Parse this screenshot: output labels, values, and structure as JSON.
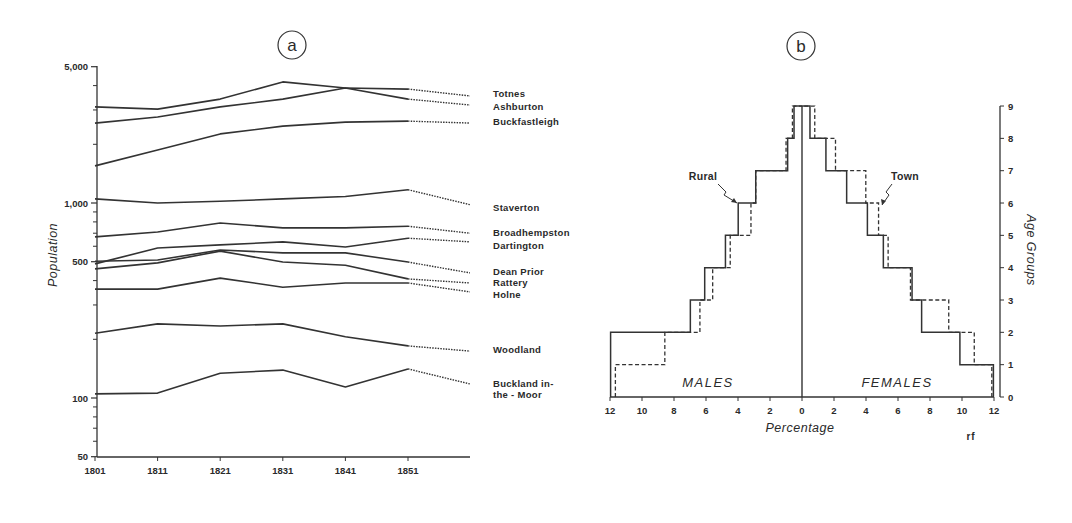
{
  "figure": {
    "panel_a": {
      "letter": "a"
    },
    "panel_b": {
      "letter": "b"
    },
    "credit": "rf"
  },
  "colors": {
    "ink": "#2a2a2a",
    "background": "#ffffff"
  },
  "chart_data": [
    {
      "id": "a",
      "type": "line",
      "title": "a",
      "xlabel": "",
      "ylabel": "Population",
      "yscale": "log",
      "ylim": [
        50,
        5000
      ],
      "y_tick_labels": [
        "5,000",
        "1,000",
        "500",
        "100",
        "50"
      ],
      "y_ticks": [
        5000,
        1000,
        500,
        100,
        50
      ],
      "y_minor_ticks": [
        4000,
        3000,
        2000,
        900,
        800,
        700,
        600,
        400,
        300,
        200,
        90,
        80,
        70,
        60
      ],
      "x": [
        "1801",
        "1811",
        "1821",
        "1831",
        "1841",
        "1851"
      ],
      "grid": false,
      "legend": "direct labels at right end of lines; dotted projection beyond 1851",
      "series": [
        {
          "name": "Totnes",
          "values": [
            2570,
            2760,
            3110,
            3410,
            3890,
            3840
          ],
          "projected_end": 3540
        },
        {
          "name": "Ashburton",
          "values": [
            3110,
            3030,
            3410,
            4180,
            3890,
            3410
          ],
          "projected_end": 3180
        },
        {
          "name": "Buckfastleigh",
          "values": [
            1550,
            1870,
            2260,
            2480,
            2600,
            2630
          ],
          "projected_end": 2570
        },
        {
          "name": "Staverton",
          "values": [
            1050,
            1000,
            1020,
            1050,
            1080,
            1170
          ],
          "projected_end": 980
        },
        {
          "name": "Broadhempston",
          "values": [
            670,
            710,
            790,
            745,
            745,
            760
          ],
          "projected_end": 700
        },
        {
          "name": "Dartington",
          "values": [
            487,
            588,
            610,
            632,
            595,
            660
          ],
          "projected_end": 632
        },
        {
          "name": "Dean Prior",
          "values": [
            503,
            510,
            574,
            555,
            555,
            498
          ],
          "projected_end": 438
        },
        {
          "name": "Rattery",
          "values": [
            459,
            493,
            567,
            498,
            480,
            408
          ],
          "projected_end": 389
        },
        {
          "name": "Holne",
          "values": [
            362,
            362,
            412,
            370,
            389,
            389
          ],
          "projected_end": 350
        },
        {
          "name": "Woodland",
          "values": [
            215,
            240,
            234,
            240,
            206,
            185
          ],
          "projected_end": 174
        },
        {
          "name": "Buckland in-the-Moor",
          "label_lines": [
            "Buckland in-",
            "the - Moor"
          ],
          "values": [
            105,
            106,
            134,
            139,
            114,
            141
          ],
          "projected_end": 118
        }
      ],
      "label_y": {
        "Totnes": 97,
        "Ashburton": 110,
        "Buckfastleigh": 125,
        "Staverton": 211,
        "Broadhempston": 236,
        "Dartington": 249,
        "Dean Prior": 275,
        "Rattery": 286,
        "Holne": 298,
        "Woodland": 353,
        "Buckland in-the-Moor": 387
      }
    },
    {
      "id": "b",
      "type": "bar",
      "subtype": "population-pyramid (step outline)",
      "title": "b",
      "xlabel": "Percentage",
      "ylabel": "Age Groups",
      "x_tick_labels": [
        "12",
        "10",
        "8",
        "6",
        "4",
        "2",
        "0",
        "2",
        "4",
        "6",
        "8",
        "10",
        "12"
      ],
      "xlim": [
        -12,
        12
      ],
      "categories": [
        "0",
        "1",
        "2",
        "3",
        "4",
        "5",
        "6",
        "7",
        "8"
      ],
      "y_tick_labels": [
        "0",
        "1",
        "2",
        "3",
        "4",
        "5",
        "6",
        "7",
        "8",
        "9"
      ],
      "side_labels": {
        "left": "MALES",
        "right": "FEMALES"
      },
      "series": [
        {
          "name": "Rural",
          "style": "solid",
          "males": [
            12.0,
            12.0,
            7.0,
            6.1,
            4.8,
            4.0,
            2.9,
            0.9,
            0.5
          ],
          "females": [
            12.0,
            9.9,
            7.5,
            6.9,
            5.1,
            4.1,
            2.8,
            1.5,
            0.5
          ]
        },
        {
          "name": "Town",
          "style": "dashed",
          "males": [
            11.7,
            8.6,
            6.4,
            5.6,
            4.5,
            3.2,
            2.9,
            1.0,
            0.6
          ],
          "females": [
            11.9,
            10.8,
            9.2,
            6.8,
            5.4,
            4.8,
            4.0,
            2.1,
            0.8
          ]
        }
      ],
      "annotations": [
        {
          "text": "Rural",
          "points_to": "males age group 5-6 (solid)"
        },
        {
          "text": "Town",
          "points_to": "females age group 5-6 (dashed)"
        }
      ],
      "grid": false
    }
  ]
}
